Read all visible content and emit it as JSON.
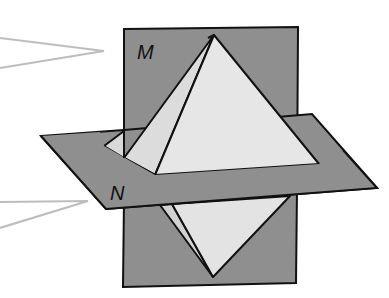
{
  "diagram": {
    "colors": {
      "background": "#ffffff",
      "plane_fill": "#8f8f8f",
      "plane_stroke": "#111111",
      "solid_fill": "#e3e3e3",
      "solid_fill_shadow": "#d2d2d2",
      "edge": "#111111",
      "callout": "#bdbdbd"
    },
    "labels": {
      "plane_m": "M",
      "plane_n": "N"
    },
    "callouts": [
      {
        "name": "callout-plane-m",
        "points": "0,38 104,51 0,68"
      },
      {
        "name": "callout-plane-n",
        "points": "0,202 88,201 0,228"
      }
    ]
  }
}
